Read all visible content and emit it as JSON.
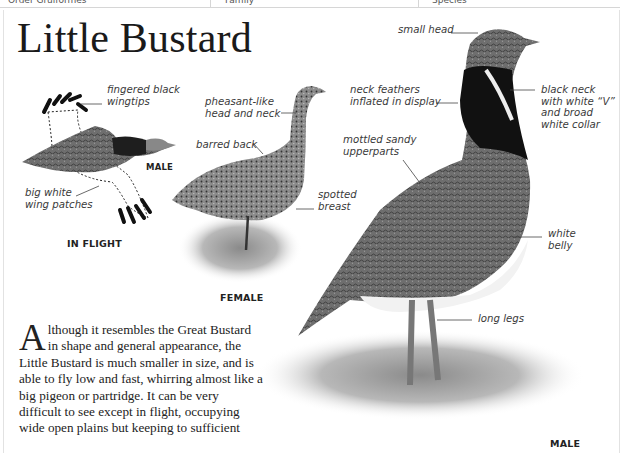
{
  "header": {
    "cells": [
      "Order Gruiformes",
      "Family",
      "Species"
    ]
  },
  "page": {
    "title": "Little Bustard"
  },
  "illustrations": {
    "in_flight": {
      "caption": "IN FLIGHT",
      "sex_label": "MALE",
      "labels": {
        "wingtips": [
          "fingered black",
          "wingtips"
        ],
        "patches": [
          "big white",
          "wing patches"
        ]
      }
    },
    "female": {
      "caption": "FEMALE",
      "labels": {
        "head": [
          "pheasant-like",
          "head and neck"
        ],
        "back": [
          "barred back"
        ],
        "breast": [
          "spotted",
          "breast"
        ]
      }
    },
    "male": {
      "caption": "MALE",
      "labels": {
        "head": [
          "small head"
        ],
        "neck_feathers": [
          "neck feathers",
          "inflated in display"
        ],
        "black_neck": [
          "black neck",
          "with white “V”",
          "and broad",
          "white collar"
        ],
        "upperparts": [
          "mottled sandy",
          "upperparts"
        ],
        "belly": [
          "white",
          "belly"
        ],
        "legs": [
          "long legs"
        ]
      }
    }
  },
  "description": {
    "dropcap": "A",
    "text": "lthough it resembles the Great Bustard in shape and general appearance, the Little Bustard is much smaller in size, and is able to fly low and fast, whirring almost like a big pigeon or partridge. It can be very difficult to see except in flight, occupying wide open plains but keeping to sufficient"
  }
}
